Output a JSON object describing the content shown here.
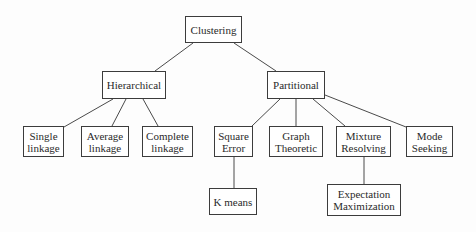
{
  "diagram": {
    "type": "tree",
    "nodes": {
      "clustering": {
        "label": "Clustering",
        "x": 185,
        "y": 16,
        "w": 57,
        "h": 27
      },
      "hierarchical": {
        "label": "Hierarchical",
        "x": 102,
        "y": 71,
        "w": 64,
        "h": 28
      },
      "partitional": {
        "label": "Partitional",
        "x": 267,
        "y": 71,
        "w": 58,
        "h": 28
      },
      "single_linkage": {
        "label": "Single\nlinkage",
        "x": 23,
        "y": 126,
        "w": 41,
        "h": 31
      },
      "average_linkage": {
        "label": "Average\nlinkage",
        "x": 81,
        "y": 126,
        "w": 48,
        "h": 31
      },
      "complete_linkage": {
        "label": "Complete\nlinkage",
        "x": 142,
        "y": 126,
        "w": 51,
        "h": 31
      },
      "square_error": {
        "label": "Square\nError",
        "x": 214,
        "y": 126,
        "w": 39,
        "h": 31
      },
      "graph_theoretic": {
        "label": "Graph\nTheoretic",
        "x": 269,
        "y": 126,
        "w": 54,
        "h": 31
      },
      "mixture_resolving": {
        "label": "Mixture\nResolving",
        "x": 336,
        "y": 126,
        "w": 55,
        "h": 31
      },
      "mode_seeking": {
        "label": "Mode\nSeeking",
        "x": 406,
        "y": 126,
        "w": 47,
        "h": 31
      },
      "k_means": {
        "label": "K means",
        "x": 209,
        "y": 188,
        "w": 48,
        "h": 27
      },
      "expectation_maximization": {
        "label": "Expectation\nMaximization",
        "x": 327,
        "y": 184,
        "w": 74,
        "h": 32
      }
    },
    "edges": [
      {
        "from": "clustering",
        "to": "hierarchical"
      },
      {
        "from": "clustering",
        "to": "partitional"
      },
      {
        "from": "hierarchical",
        "to": "single_linkage"
      },
      {
        "from": "hierarchical",
        "to": "average_linkage"
      },
      {
        "from": "hierarchical",
        "to": "complete_linkage"
      },
      {
        "from": "partitional",
        "to": "square_error"
      },
      {
        "from": "partitional",
        "to": "graph_theoretic"
      },
      {
        "from": "partitional",
        "to": "mixture_resolving"
      },
      {
        "from": "partitional",
        "to": "mode_seeking"
      },
      {
        "from": "square_error",
        "to": "k_means"
      },
      {
        "from": "mixture_resolving",
        "to": "expectation_maximization"
      }
    ],
    "colors": {
      "background": "#fdfdfd",
      "box_border": "#3c3c3c",
      "line": "#4a4a4a",
      "text": "#2a2a2a"
    }
  }
}
